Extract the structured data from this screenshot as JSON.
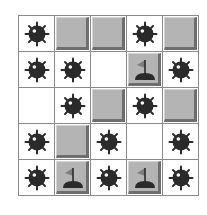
{
  "game": "minesweeper",
  "rows": 5,
  "cols": 5,
  "colors": {
    "grid_line": "#8a8a8a",
    "covered_tile": "#b4b4b4",
    "tile_shadow": "#6e6e6e",
    "mine": "#2a2a2a",
    "revealed": "#ffffff"
  },
  "board": [
    [
      "mine",
      "covered",
      "covered",
      "mine",
      "covered"
    ],
    [
      "mine",
      "mine",
      "empty",
      "flag",
      "mine"
    ],
    [
      "empty",
      "mine",
      "covered",
      "mine",
      "covered"
    ],
    [
      "mine",
      "covered",
      "mine",
      "empty",
      "mine"
    ],
    [
      "mine",
      "flag",
      "mine",
      "flag",
      "mine"
    ]
  ],
  "icons": {
    "mine": "mine-icon",
    "flag": "flag-icon"
  }
}
